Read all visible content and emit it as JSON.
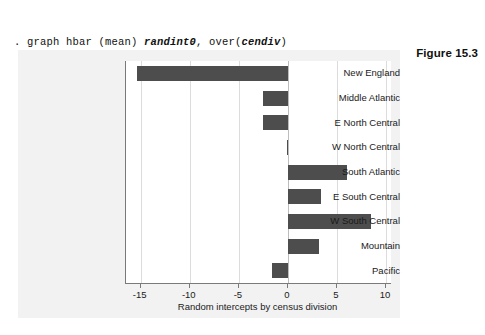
{
  "command": {
    "line1_prefix": ". graph hbar (mean) ",
    "line1_var": "randint0",
    "line1_mid": ", over(",
    "line1_var2": "cendiv",
    "line1_suffix": ")",
    "line2": "ytitle(\"Random intercepts by census division\")"
  },
  "figure": {
    "caption": "Figure 15.3"
  },
  "colors": {
    "bar": "#4d4d4d",
    "graph_background": "#f2f2f2",
    "plot_background": "#ffffff",
    "axis": "#7a7a7a",
    "gridline": "#dcdcdc"
  },
  "chart_data": {
    "type": "bar",
    "orientation": "horizontal",
    "title": "",
    "xlabel": "Random intercepts by census division",
    "ylabel": "",
    "categories": [
      "New England",
      "Middle Atlantic",
      "E North Central",
      "W North Central",
      "South Atlantic",
      "E South Central",
      "W South Central",
      "Mountain",
      "Pacific"
    ],
    "values": [
      -15.4,
      -2.5,
      -2.5,
      -0.1,
      6.0,
      3.4,
      8.5,
      3.2,
      -1.6
    ],
    "xlim": [
      -16.5,
      10.5
    ],
    "xticks": [
      -15,
      -10,
      -5,
      0,
      5,
      10
    ],
    "xtick_labels": [
      "-15",
      "-10",
      "-5",
      "0",
      "5",
      "10"
    ],
    "grid": true,
    "legend": "none"
  }
}
